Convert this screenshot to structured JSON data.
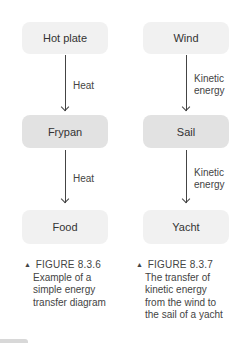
{
  "diagrams": [
    {
      "nodes": [
        "Hot plate",
        "Frypan",
        "Food"
      ],
      "edges": [
        "Heat",
        "Heat"
      ],
      "caption": {
        "figure": "FIGURE 8.3.6",
        "lines": [
          "Example of a",
          "simple energy",
          "transfer diagram"
        ]
      }
    },
    {
      "nodes": [
        "Wind",
        "Sail",
        "Yacht"
      ],
      "edges": [
        [
          "Kinetic",
          "energy"
        ],
        [
          "Kinetic",
          "energy"
        ]
      ],
      "caption": {
        "figure": "FIGURE 8.3.7",
        "lines": [
          "The transfer of",
          "kinetic energy",
          "from the wind to",
          "the sail of a yacht"
        ]
      }
    }
  ],
  "caption_marker": "▲",
  "colors": {
    "box_light": "#f1f1f1",
    "box_dark": "#e2e2e2",
    "arrow": "#444444",
    "text": "#333333"
  }
}
